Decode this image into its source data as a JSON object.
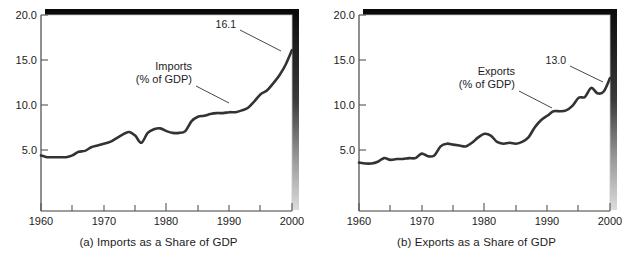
{
  "figure": {
    "panels": [
      {
        "id": "a",
        "caption": "(a) Imports as a Share of GDP",
        "annotation_line1": "Imports",
        "annotation_line2": "(% of GDP)",
        "endpoint_label": "16.1"
      },
      {
        "id": "b",
        "caption": "(b) Exports as a Share of GDP",
        "annotation_line1": "Exports",
        "annotation_line2": "(% of GDP)",
        "endpoint_label": "13.0"
      }
    ],
    "colors": {
      "line": "#333333",
      "axis": "#555555",
      "text": "#1c1c1c",
      "shadow_dark": "#0a0a0a",
      "shadow_light": "#d8d8d8",
      "background": "#ffffff"
    }
  },
  "chart_data": [
    {
      "type": "line",
      "title": "(a) Imports as a Share of GDP",
      "xlabel": "",
      "ylabel": "",
      "xlim": [
        1960,
        2000
      ],
      "ylim": [
        0,
        20
      ],
      "yticks": [
        5.0,
        10.0,
        15.0,
        20.0
      ],
      "ytick_labels": [
        "5.0",
        "10.0",
        "15.0",
        "20.0"
      ],
      "xticks": [
        1960,
        1965,
        1970,
        1975,
        1980,
        1985,
        1990,
        1995,
        2000
      ],
      "xtick_labels": [
        "1960",
        "",
        "1970",
        "",
        "1980",
        "",
        "1990",
        "",
        "2000"
      ],
      "grid": false,
      "legend": "inline-annotation",
      "annotations": [
        {
          "text": "Imports (% of GDP)",
          "x": 1978,
          "y": 12.8
        },
        {
          "text": "16.1",
          "x": 1997,
          "y": 18.3
        }
      ],
      "series": [
        {
          "name": "Imports (% of GDP)",
          "x": [
            1960,
            1961,
            1962,
            1963,
            1964,
            1965,
            1966,
            1967,
            1968,
            1969,
            1970,
            1971,
            1972,
            1973,
            1974,
            1975,
            1976,
            1977,
            1978,
            1979,
            1980,
            1981,
            1982,
            1983,
            1984,
            1985,
            1986,
            1987,
            1988,
            1989,
            1990,
            1991,
            1992,
            1993,
            1994,
            1995,
            1996,
            1997,
            1998,
            1999,
            2000
          ],
          "values": [
            4.4,
            4.2,
            4.2,
            4.2,
            4.2,
            4.4,
            4.8,
            4.9,
            5.3,
            5.5,
            5.7,
            5.9,
            6.3,
            6.7,
            7.0,
            6.6,
            5.8,
            6.9,
            7.3,
            7.4,
            7.1,
            6.9,
            6.9,
            7.1,
            8.2,
            8.7,
            8.8,
            9.0,
            9.1,
            9.1,
            9.2,
            9.2,
            9.4,
            9.7,
            10.4,
            11.2,
            11.6,
            12.4,
            13.3,
            14.5,
            16.1
          ]
        }
      ]
    },
    {
      "type": "line",
      "title": "(b) Exports as a Share of GDP",
      "xlabel": "",
      "ylabel": "",
      "xlim": [
        1960,
        2000
      ],
      "ylim": [
        0,
        20
      ],
      "yticks": [
        5.0,
        10.0,
        15.0,
        20.0
      ],
      "ytick_labels": [
        "5.0",
        "10.0",
        "15.0",
        "20.0"
      ],
      "xticks": [
        1960,
        1965,
        1970,
        1975,
        1980,
        1985,
        1990,
        1995,
        2000
      ],
      "xtick_labels": [
        "1960",
        "",
        "1970",
        "",
        "1980",
        "",
        "1990",
        "",
        "2000"
      ],
      "grid": false,
      "legend": "inline-annotation",
      "annotations": [
        {
          "text": "Exports (% of GDP)",
          "x": 1978,
          "y": 12.4
        },
        {
          "text": "13.0",
          "x": 1995,
          "y": 14.8
        }
      ],
      "series": [
        {
          "name": "Exports (% of GDP)",
          "x": [
            1960,
            1961,
            1962,
            1963,
            1964,
            1965,
            1966,
            1967,
            1968,
            1969,
            1970,
            1971,
            1972,
            1973,
            1974,
            1975,
            1976,
            1977,
            1978,
            1979,
            1980,
            1981,
            1982,
            1983,
            1984,
            1985,
            1986,
            1987,
            1988,
            1989,
            1990,
            1991,
            1992,
            1993,
            1994,
            1995,
            1996,
            1997,
            1998,
            1999,
            2000
          ],
          "values": [
            3.6,
            3.5,
            3.5,
            3.7,
            4.1,
            3.9,
            4.0,
            4.0,
            4.1,
            4.1,
            4.6,
            4.3,
            4.4,
            5.4,
            5.7,
            5.6,
            5.5,
            5.4,
            5.8,
            6.4,
            6.8,
            6.6,
            5.9,
            5.7,
            5.8,
            5.7,
            5.9,
            6.4,
            7.5,
            8.3,
            8.8,
            9.3,
            9.3,
            9.4,
            9.9,
            10.8,
            10.9,
            11.9,
            11.3,
            11.5,
            13.0
          ]
        }
      ]
    }
  ]
}
